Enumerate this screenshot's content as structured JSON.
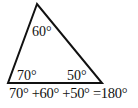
{
  "diagram": {
    "type": "triangle-angle-sum",
    "angles": {
      "top": "60°",
      "bottom_left": "70°",
      "bottom_right": "50°"
    },
    "equation": "70° +60° +50° =180°",
    "stroke_color": "#111111"
  }
}
